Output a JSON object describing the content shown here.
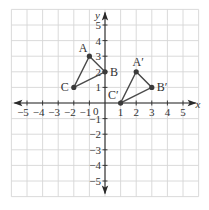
{
  "diagram": {
    "type": "coordinate-grid-transformation",
    "x_range": [
      -6,
      6
    ],
    "y_range": [
      -6,
      6
    ],
    "axis_labels": {
      "x": "x",
      "y": "y"
    },
    "origin_label": "0",
    "x_ticks": [
      {
        "value": -5,
        "label": "−5"
      },
      {
        "value": -4,
        "label": "−4"
      },
      {
        "value": -3,
        "label": "−3"
      },
      {
        "value": -2,
        "label": "−2"
      },
      {
        "value": -1,
        "label": "−1"
      },
      {
        "value": 1,
        "label": "1"
      },
      {
        "value": 2,
        "label": "2"
      },
      {
        "value": 3,
        "label": "3"
      },
      {
        "value": 4,
        "label": "4"
      },
      {
        "value": 5,
        "label": "5"
      }
    ],
    "y_ticks": [
      {
        "value": 5,
        "label": "5"
      },
      {
        "value": 4,
        "label": "4"
      },
      {
        "value": 3,
        "label": "3"
      },
      {
        "value": 2,
        "label": "2"
      },
      {
        "value": 1,
        "label": "1"
      },
      {
        "value": -1,
        "label": "−1"
      },
      {
        "value": -2,
        "label": "−2"
      },
      {
        "value": -3,
        "label": "−3"
      },
      {
        "value": -4,
        "label": "−4"
      },
      {
        "value": -5,
        "label": "−5"
      }
    ],
    "triangles": [
      {
        "name": "ABC",
        "vertices": [
          {
            "label": "A",
            "x": -1,
            "y": 3,
            "label_pos": "upper-left"
          },
          {
            "label": "B",
            "x": 0,
            "y": 2,
            "label_pos": "right"
          },
          {
            "label": "C",
            "x": -2,
            "y": 1,
            "label_pos": "left"
          }
        ]
      },
      {
        "name": "A'B'C'",
        "vertices": [
          {
            "label": "A′",
            "x": 2,
            "y": 2,
            "label_pos": "above"
          },
          {
            "label": "B′",
            "x": 3,
            "y": 1,
            "label_pos": "right"
          },
          {
            "label": "C′",
            "x": 1,
            "y": 0,
            "label_pos": "upper-left"
          }
        ]
      }
    ],
    "colors": {
      "grid": "#d6d6d6",
      "axis": "#2a2a2a",
      "triangle": "#4a4a4a"
    }
  }
}
